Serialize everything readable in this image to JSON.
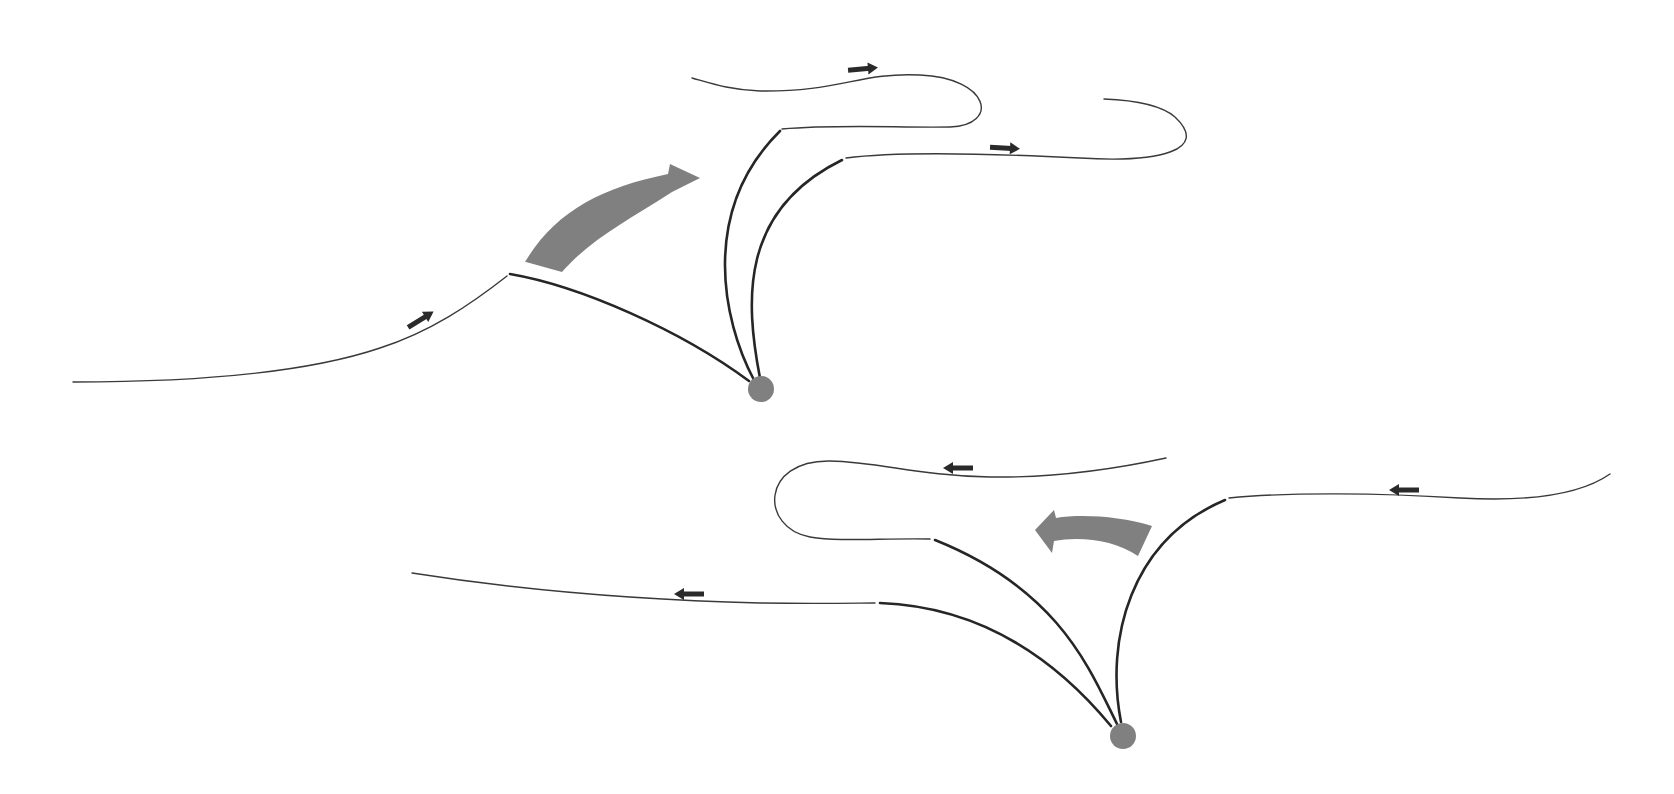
{
  "diagram": {
    "colors": {
      "background": "#ffffff",
      "line": "#262626",
      "node": "#808080",
      "big_arrow": "#808080",
      "small_arrow": "#2a2a2a"
    },
    "upper_group": {
      "flow_direction": "right",
      "big_arrow_direction": "up-right",
      "node_count": 1,
      "line_count": 5,
      "small_arrows": [
        "up-right",
        "right",
        "right"
      ]
    },
    "lower_group": {
      "flow_direction": "left",
      "big_arrow_direction": "left",
      "node_count": 1,
      "line_count": 5,
      "small_arrows": [
        "left",
        "left",
        "left"
      ]
    }
  }
}
